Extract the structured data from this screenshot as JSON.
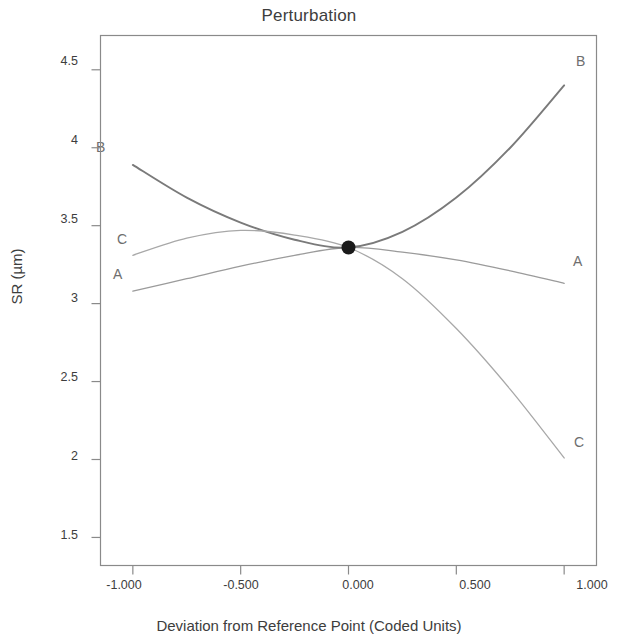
{
  "chart_data": {
    "type": "line",
    "title": "Perturbation",
    "xlabel": "Deviation from Reference Point (Coded Units)",
    "ylabel": "SR (µm)",
    "xlim": [
      -1.15,
      1.15
    ],
    "ylim": [
      1.32,
      4.72
    ],
    "grid": false,
    "legend": "inline-endpoint-labels",
    "xticks": [
      -1,
      -0.5,
      0,
      0.5,
      1
    ],
    "xtick_labels": [
      "-1.000",
      "-0.500",
      "0.000",
      "0.500",
      "1.000"
    ],
    "yticks": [
      1.5,
      2,
      2.5,
      3,
      3.5,
      4,
      4.5
    ],
    "ytick_labels": [
      "1.5",
      "2",
      "2.5",
      "3",
      "3.5",
      "4",
      "4.5"
    ],
    "reference_point": {
      "x": 0.0,
      "y": 3.36,
      "marker": "filled-circle",
      "color": "#1a1a1a"
    },
    "series": [
      {
        "name": "A",
        "label_left": "A",
        "label_right": "A",
        "color": "#9b9b9b",
        "x": [
          -1,
          -0.75,
          -0.5,
          -0.25,
          0,
          0.25,
          0.5,
          0.75,
          1
        ],
        "values": [
          3.08,
          3.16,
          3.24,
          3.31,
          3.36,
          3.33,
          3.28,
          3.21,
          3.13
        ]
      },
      {
        "name": "B",
        "label_left": "B",
        "label_right": "B",
        "color": "#7a7a7a",
        "x": [
          -1,
          -0.75,
          -0.5,
          -0.25,
          0,
          0.25,
          0.5,
          0.75,
          1
        ],
        "values": [
          3.89,
          3.68,
          3.52,
          3.41,
          3.36,
          3.46,
          3.68,
          4.0,
          4.4
        ]
      },
      {
        "name": "C",
        "label_left": "C",
        "label_right": "C",
        "color": "#a8a8a8",
        "x": [
          -1,
          -0.75,
          -0.5,
          -0.25,
          0,
          0.25,
          0.5,
          0.75,
          1
        ],
        "values": [
          3.31,
          3.42,
          3.47,
          3.44,
          3.36,
          3.16,
          2.84,
          2.45,
          2.01
        ]
      }
    ]
  },
  "chart": {
    "title": "Perturbation",
    "ylabel": "SR (µm)",
    "xlabel": "Deviation from Reference Point (Coded Units)",
    "ytick_0": "4.5",
    "ytick_1": "4",
    "ytick_2": "3.5",
    "ytick_3": "3",
    "ytick_4": "2.5",
    "ytick_5": "2",
    "ytick_6": "1.5",
    "xtick_0": "-1.000",
    "xtick_1": "-0.500",
    "xtick_2": "0.000",
    "xtick_3": "0.500",
    "xtick_4": "1.000",
    "label_B_left": "B",
    "label_C_left": "C",
    "label_A_left": "A",
    "label_B_right": "B",
    "label_A_right": "A",
    "label_C_right": "C"
  }
}
